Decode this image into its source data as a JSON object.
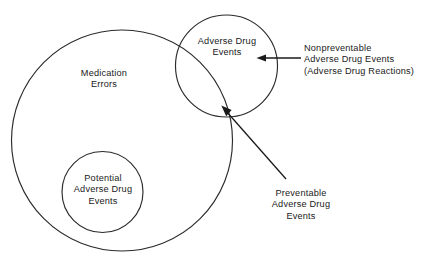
{
  "diagram": {
    "type": "venn-diagram",
    "background_color": "#ffffff",
    "stroke_color": "#2b2b2b",
    "text_color": "#1a1a1a",
    "sets": {
      "medication_errors": {
        "label_lines": [
          "Medication",
          "Errors"
        ],
        "line1": "Medication",
        "line2": "Errors"
      },
      "adverse_drug_events": {
        "label_lines": [
          "Adverse Drug",
          "Events"
        ],
        "line1": "Adverse Drug",
        "line2": "Events"
      },
      "potential_adverse_drug_events": {
        "label_lines": [
          "Potential",
          "Adverse Drug",
          "Events"
        ],
        "line1": "Potential",
        "line2": "Adverse Drug",
        "line3": "Events"
      }
    },
    "annotations": {
      "nonpreventable": {
        "line1": "Nonpreventable",
        "line2": "Adverse Drug Events",
        "line3": "(Adverse Drug Reactions)",
        "arrow": "horizontal-left-arrow"
      },
      "preventable": {
        "line1": "Preventable",
        "line2": "Adverse Drug",
        "line3": "Events",
        "arrow": "diagonal-up-left-arrow"
      }
    }
  }
}
